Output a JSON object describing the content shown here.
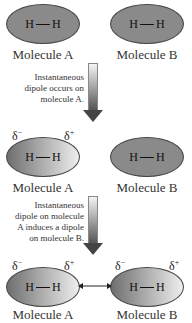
{
  "rows": [
    {
      "molecule_a": {
        "formula": [
          "H",
          "H"
        ],
        "label": "Molecule A",
        "style": "neutral"
      },
      "molecule_b": {
        "formula": [
          "H",
          "H"
        ],
        "label": "Molecule B",
        "style": "neutral"
      }
    },
    {
      "molecule_a": {
        "formula": [
          "H",
          "H"
        ],
        "label": "Molecule A",
        "style": "dipole",
        "delta_neg": "δ",
        "delta_neg_sign": "−",
        "delta_pos": "δ",
        "delta_pos_sign": "+"
      },
      "molecule_b": {
        "formula": [
          "H",
          "H"
        ],
        "label": "Molecule B",
        "style": "neutral"
      }
    },
    {
      "molecule_a": {
        "formula": [
          "H",
          "H"
        ],
        "label": "Molecule A",
        "style": "dipole",
        "delta_neg": "δ",
        "delta_neg_sign": "−",
        "delta_pos": "δ",
        "delta_pos_sign": "+"
      },
      "molecule_b": {
        "formula": [
          "H",
          "H"
        ],
        "label": "Molecule B",
        "style": "dipole",
        "delta_neg": "δ",
        "delta_neg_sign": "−",
        "delta_pos": "δ",
        "delta_pos_sign": "+"
      }
    }
  ],
  "steps": [
    {
      "caption_lines": [
        "Instantaneous",
        "dipole occurs on",
        "molecule A."
      ]
    },
    {
      "caption_lines": [
        "Instantaneous",
        "dipole on molecule",
        "A induces a dipole",
        "on molecule B."
      ]
    }
  ],
  "interaction_arrow": "double-headed"
}
